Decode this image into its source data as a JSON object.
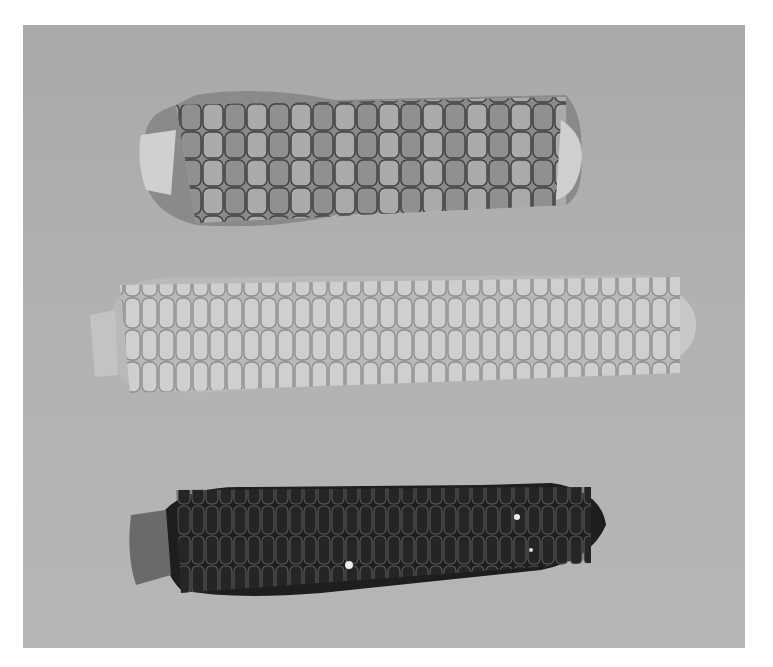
{
  "image": {
    "description": "Grayscale photograph of three ears of corn laid horizontally on a gray background",
    "background_color": "#afafaf",
    "margin_color": "#ffffff"
  },
  "cobs": [
    {
      "name": "top-cob",
      "appearance": "mottled light and dark kernels",
      "base_color": "#8a8a8a",
      "kernel_light": "#c9c9c9",
      "kernel_dark": "#5a5a5a"
    },
    {
      "name": "middle-cob",
      "appearance": "uniform light kernels",
      "base_color": "#b8b8b8",
      "kernel_light": "#d6d6d6",
      "kernel_dark": "#9a9a9a"
    },
    {
      "name": "bottom-cob",
      "appearance": "dark kernels",
      "base_color": "#222222",
      "kernel_light": "#3a3a3a",
      "kernel_dark": "#111111"
    }
  ]
}
